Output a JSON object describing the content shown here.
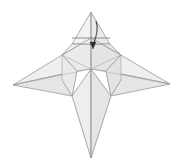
{
  "figure": {
    "title": "Origami folding step diagram",
    "background_color": "#ffffff",
    "paper_fill_light": "#f4f4f4",
    "paper_fill_mid": "#ececec",
    "paper_fill_dark": "#e2e2e2",
    "paper_fill_shadow": "#d9d9d9",
    "edge_color": "#8a8a8a",
    "crease_color": "#b4b4b4",
    "arrow_color": "#4a4a4a",
    "canvas": {
      "width": 182,
      "height": 168
    }
  },
  "geometry": {
    "top_apex": "91,12",
    "left_wing_tip": "13,85",
    "right_wing_tip": "170,84",
    "bottom_point": "91,158",
    "center_hub": "91,69",
    "fold_line_y": 38,
    "fold_line_x_start": 72,
    "fold_line_x_end": 110
  },
  "annotations": {
    "arrow": {
      "name": "fold-down-arrow",
      "label": "fold the top flap downward",
      "direction": "down",
      "tail": "96,22",
      "head": "93,47"
    },
    "fold_line": {
      "name": "valley-fold-line",
      "label": "fold line across the top flap"
    }
  },
  "shapes": {
    "top_flap_left": "Upper flap left facet",
    "top_flap_right": "Upper flap right facet",
    "upper_left_panel": "Upper left body panel",
    "upper_right_panel": "Upper right body panel",
    "left_wing_upper": "Left wing upper facet",
    "left_wing_lower": "Left wing lower facet",
    "right_wing_upper": "Right wing upper facet",
    "right_wing_lower": "Right wing lower facet",
    "body_left": "Lower body left facet",
    "body_right": "Lower body right facet"
  }
}
